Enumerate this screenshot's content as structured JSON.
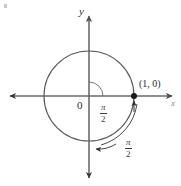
{
  "figure": {
    "width": 181,
    "height": 186,
    "background": "#ffffff",
    "ink_color": "#4a4a4a",
    "label_color": "#2b2b2b"
  },
  "axes": {
    "x_label": "x",
    "y_label": "y",
    "origin_label": "0",
    "x_axis_y": 96,
    "y_axis_x": 89,
    "x_range_px": [
      4,
      177
    ],
    "y_range_px": [
      10,
      180
    ]
  },
  "circle": {
    "center_x": 89,
    "center_y": 96,
    "radius": 45,
    "stroke": "#4a4a4a"
  },
  "points": [
    {
      "name": "point-1-0",
      "label": "(1, 0)",
      "x": 134,
      "y": 96,
      "marker": "filled-dot"
    }
  ],
  "angle_labels": [
    {
      "name": "inner-angle-label",
      "numerator": "π",
      "denominator": "2",
      "text": "π/2",
      "x": 105,
      "y": 105
    },
    {
      "name": "outer-arc-label",
      "numerator": "π",
      "denominator": "2",
      "text": "π/2",
      "x": 129,
      "y": 142
    }
  ],
  "arcs": [
    {
      "name": "inner-angle-arc",
      "description": "small arc from positive x-axis sweeping clockwise to negative y-axis at origin",
      "radius": 14
    },
    {
      "name": "outer-sweep-arrow",
      "description": "curved arrow from (1,0) clockwise around to negative y-axis, arrowhead at each end",
      "radius": 52
    }
  ],
  "corner_artifact": {
    "name": "scan-artifact",
    "visible": true
  }
}
